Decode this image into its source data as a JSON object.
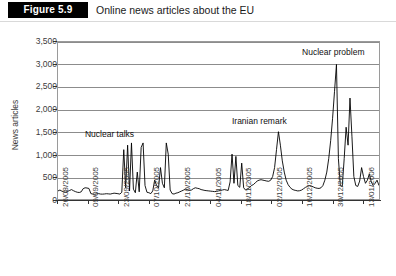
{
  "header": {
    "figure_tag": "Figure 5.9",
    "title": "Online news articles about the EU"
  },
  "chart_data": {
    "type": "line",
    "title": "Online news articles about the EU",
    "xlabel": "",
    "ylabel": "News articles",
    "ylim": [
      0,
      3500
    ],
    "ytick_values": [
      0,
      500,
      1000,
      1500,
      2000,
      2500,
      3000,
      3500
    ],
    "ytick_labels": [
      "0",
      "500",
      "1,000",
      "1,500",
      "2,000",
      "2,500",
      "3,000",
      "3,500"
    ],
    "grid": true,
    "legend": "none",
    "line_color": "#000000",
    "x_tick_labels": [
      "26/08/2005",
      "09/09/2005",
      "23/09/2005",
      "07/10/2005",
      "21/10/2005",
      "04/11/2005",
      "18/11/2005",
      "02/12/2005",
      "16/12/2005",
      "30/12/2005",
      "13/01/2006"
    ],
    "x_tick_interval_days": 14,
    "x_range": [
      "26/08/2005",
      "27/01/2006"
    ],
    "annotations": [
      {
        "text": "Nuclear talks",
        "x_index": 27,
        "y_value": 1450
      },
      {
        "text": "Iranian remark",
        "x_index": 104,
        "y_value": 1750
      },
      {
        "text": "Nuclear problem",
        "x_index": 142,
        "y_value": 3250
      }
    ],
    "series": [
      {
        "name": "News articles",
        "values": [
          180,
          200,
          175,
          160,
          150,
          170,
          190,
          210,
          185,
          165,
          150,
          145,
          160,
          230,
          250,
          245,
          235,
          120,
          110,
          105,
          115,
          120,
          110,
          108,
          112,
          118,
          115,
          110,
          120,
          130,
          125,
          118,
          110,
          150,
          1100,
          250,
          1200,
          180,
          1250,
          220,
          140,
          600,
          160,
          1150,
          1250,
          300,
          150,
          140,
          120,
          180,
          420,
          300,
          250,
          700,
          350,
          250,
          1250,
          1000,
          200,
          120,
          110,
          130,
          140,
          160,
          180,
          200,
          220,
          210,
          190,
          200,
          230,
          250,
          240,
          230,
          210,
          200,
          190,
          185,
          180,
          175,
          170,
          165,
          170,
          180,
          190,
          200,
          210,
          200,
          190,
          380,
          1000,
          350,
          950,
          300,
          260,
          800,
          250,
          200,
          230,
          250,
          300,
          320,
          360,
          400,
          420,
          430,
          420,
          410,
          400,
          395,
          420,
          500,
          700,
          1100,
          1500,
          1200,
          850,
          600,
          420,
          320,
          260,
          220,
          200,
          190,
          180,
          185,
          200,
          230,
          260,
          280,
          300,
          290,
          270,
          250,
          240,
          235,
          250,
          300,
          420,
          600,
          900,
          1300,
          1800,
          2400,
          3000,
          900,
          300,
          280,
          900,
          1600,
          1200,
          2250,
          1400,
          500,
          300,
          280,
          400,
          700,
          500,
          350,
          420,
          560,
          380,
          300,
          350,
          420,
          300
        ]
      }
    ]
  }
}
